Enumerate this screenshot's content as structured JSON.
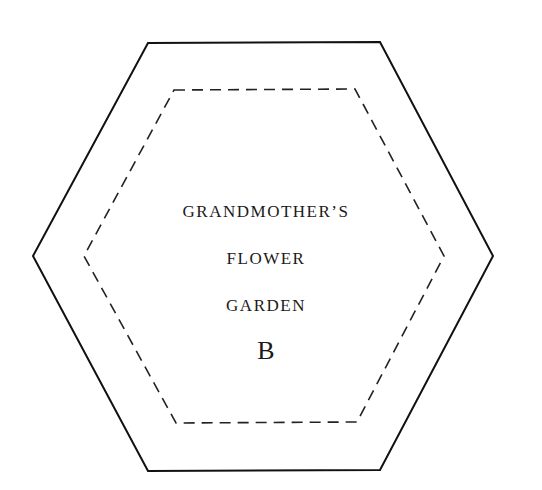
{
  "template": {
    "title_lines": [
      "GRANDMOTHER’S",
      "FLOWER",
      "GARDEN"
    ],
    "piece_letter": "B",
    "outer_line": "solid",
    "inner_line": "dashed",
    "shape": "hexagon",
    "stroke_color": "#111111"
  }
}
